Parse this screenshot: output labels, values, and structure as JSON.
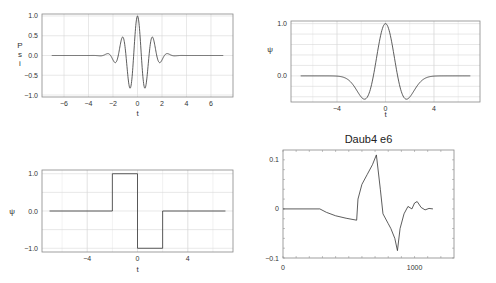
{
  "chart_data": [
    {
      "type": "line",
      "name": "morlet-wavelet",
      "title": "",
      "xlabel": "t",
      "ylabel": "Psi",
      "xlim": [
        -7.8,
        7.8
      ],
      "ylim": [
        -1.05,
        1.05
      ],
      "xticks": [
        -6,
        -4,
        -2,
        0,
        2,
        4,
        6
      ],
      "yticks": [
        -1.0,
        -0.5,
        0.0,
        0.5,
        1.0
      ],
      "xtick_labels": [
        "-6",
        "-4",
        "-2",
        "0",
        "2",
        "4",
        "6"
      ],
      "ytick_labels": [
        "-1.0",
        "-0.5",
        "0.0",
        "0.5",
        "1.0"
      ],
      "grid": true,
      "function": "cos(5t)*exp(-t^2/2)",
      "x": [
        -7,
        -3,
        -2.5,
        -2.2,
        -1.9,
        -1.6,
        -1.25,
        -0.95,
        -0.63,
        -0.3,
        0,
        0.3,
        0.63,
        0.95,
        1.25,
        1.6,
        1.9,
        2.2,
        2.5,
        3,
        7
      ],
      "values": [
        0,
        0,
        -0.05,
        0.1,
        -0.2,
        0.38,
        -0.62,
        0.85,
        -1.0,
        1.0,
        -0.85,
        0.62,
        -0.38,
        0.2,
        -0.1,
        0.05,
        0,
        0,
        0,
        0,
        0
      ]
    },
    {
      "type": "line",
      "name": "mexican-hat-wavelet",
      "title": "",
      "xlabel": "t",
      "ylabel": "ψ",
      "xlim": [
        -7.8,
        7.8
      ],
      "ylim": [
        -0.5,
        1.05
      ],
      "xticks": [
        -4,
        0,
        4
      ],
      "yticks": [
        0.0,
        1.0
      ],
      "xtick_labels": [
        "-4",
        "0",
        "4"
      ],
      "ytick_labels": [
        "0.0",
        "1.0"
      ],
      "grid": true,
      "function": "(1-t^2)*exp(-t^2/2)",
      "x": [
        -7,
        -5,
        -4,
        -3,
        -2,
        -1.73,
        -1,
        0,
        1,
        1.73,
        2,
        3,
        4,
        5,
        7
      ],
      "values": [
        0,
        -0.01,
        -0.05,
        -0.09,
        -0.41,
        -0.45,
        0,
        1.0,
        0,
        -0.45,
        -0.41,
        -0.09,
        -0.05,
        -0.01,
        0
      ]
    },
    {
      "type": "line",
      "name": "haar-wavelet",
      "title": "",
      "xlabel": "t",
      "ylabel": "ψ",
      "xlim": [
        -7.6,
        7.6
      ],
      "ylim": [
        -1.1,
        1.1
      ],
      "xticks": [
        -4,
        0,
        4
      ],
      "yticks": [
        -1.0,
        0.0,
        1.0
      ],
      "xtick_labels": [
        "-4",
        "0",
        "4"
      ],
      "ytick_labels": [
        "-1.0",
        "0.0",
        "1.0"
      ],
      "grid": true,
      "x": [
        -7,
        -2,
        -2,
        0,
        0,
        2,
        2,
        7
      ],
      "values": [
        0,
        0,
        1,
        1,
        -1,
        -1,
        0,
        0
      ]
    },
    {
      "type": "line",
      "name": "daubechies-wavelet",
      "title": "Daub4 e6",
      "xlabel": "",
      "ylabel": "",
      "xlim": [
        0,
        1300
      ],
      "ylim": [
        -0.1,
        0.12
      ],
      "xticks": [
        0,
        1000
      ],
      "yticks": [
        -0.1,
        0,
        0.1
      ],
      "xtick_labels": [
        "0",
        "1000"
      ],
      "ytick_labels": [
        "-0.1",
        "0",
        "0.1"
      ],
      "grid": false,
      "x": [
        0,
        280,
        330,
        400,
        480,
        560,
        570,
        600,
        640,
        680,
        710,
        740,
        760,
        800,
        820,
        850,
        870,
        890,
        920,
        950,
        980,
        1000,
        1020,
        1050,
        1080,
        1110,
        1140
      ],
      "values": [
        0,
        0,
        -0.007,
        -0.014,
        -0.019,
        -0.023,
        0.02,
        0.05,
        0.07,
        0.09,
        0.11,
        0.04,
        -0.01,
        -0.03,
        -0.04,
        -0.06,
        -0.085,
        -0.04,
        -0.01,
        0.005,
        0.0,
        0.012,
        0.015,
        0.003,
        -0.002,
        0.001,
        0
      ]
    }
  ]
}
